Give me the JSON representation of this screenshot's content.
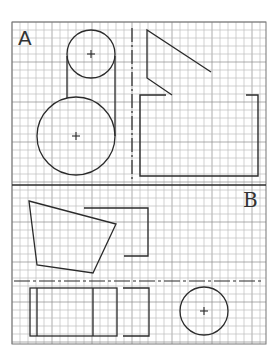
{
  "sheet": {
    "width": 279,
    "height": 355,
    "background": "#ffffff",
    "grid": {
      "x0": 12,
      "y0": 22,
      "x1": 266,
      "y1": 344,
      "cell": 8,
      "minor_color": "#bdbdbd",
      "major_color": "#8a8a8a",
      "major_every": 5
    },
    "stroke_color": "#2b2b2b",
    "section_divider_y": 185
  },
  "sections": [
    {
      "id": "A",
      "label": "A"
    },
    {
      "id": "B",
      "label": "B"
    }
  ],
  "section_a": {
    "small_circle": {
      "cx": 91,
      "cy": 54,
      "r": 24
    },
    "large_circle": {
      "cx": 76,
      "cy": 136,
      "r": 39
    },
    "tangent_lines": [
      {
        "x1": 67,
        "y1": 56,
        "x2": 67,
        "y2": 98
      },
      {
        "x1": 115,
        "y1": 56,
        "x2": 115,
        "y2": 136
      }
    ],
    "center_dash_line": {
      "x": 132,
      "y1": 28,
      "y2": 180
    },
    "diagonal_polyline": "211,72 147,30 147,78 172,95",
    "open_rectangle": {
      "path": "M166,95 L140,95 L140,176 L258,176 L258,95 L246,95"
    }
  },
  "section_b": {
    "quadrilateral": "29,201 116,224 93,273 37,265",
    "bracket_top": "M84,208 L148,208 L148,256 L124,256",
    "dash_divider": {
      "y": 281,
      "x1": 14,
      "x2": 264
    },
    "rectangle_outer": {
      "x": 30,
      "y": 288,
      "w": 87,
      "h": 48
    },
    "rectangle_inner_lines": [
      37,
      93
    ],
    "bracket_bottom": "M123,288 L149,288 L149,336 L123,336",
    "circle": {
      "cx": 204,
      "cy": 311,
      "r": 24
    }
  }
}
